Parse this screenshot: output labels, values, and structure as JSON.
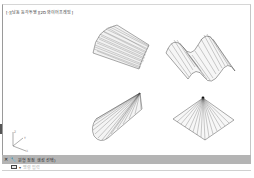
{
  "viewport": {
    "label": "[-][남동 등각투영][2D 와이어프레임]",
    "objects": [
      {
        "name": "curved-ruled-surface",
        "type": "ruled-surface"
      },
      {
        "name": "wave-ruled-surface",
        "type": "ruled-surface"
      },
      {
        "name": "cone-ruled-surface",
        "type": "ruled-surface"
      },
      {
        "name": "pyramid-ruled-surface",
        "type": "ruled-surface"
      }
    ],
    "ucs": {
      "x_label": "X",
      "y_label": "Y",
      "z_label": "Z"
    }
  },
  "command_line": {
    "close_icon": "✕",
    "settings_icon": "🔧",
    "prompt": "원형 정점 생성 선택)",
    "input_placeholder": "명령 입력",
    "colors": {
      "bar": "#b4b4b4",
      "input": "#ffffff"
    }
  }
}
